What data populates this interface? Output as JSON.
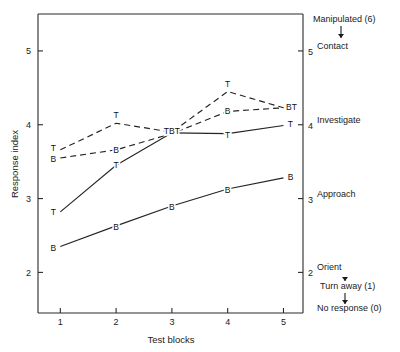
{
  "chart_data": {
    "type": "line",
    "title": "",
    "xlabel": "Test blocks",
    "ylabel": "Response index",
    "x": [
      1,
      2,
      3,
      4,
      5
    ],
    "xtick_labels": [
      "1",
      "2",
      "3",
      "4",
      "5"
    ],
    "xlim": [
      0.6,
      5.35
    ],
    "ylim": [
      1.45,
      5.5
    ],
    "ytick_values": [
      2,
      3,
      4,
      5
    ],
    "ytick_labels": [
      "2",
      "3",
      "4",
      "5"
    ],
    "grid": false,
    "legend_position": "none",
    "right_axis": {
      "tick_values": [
        2,
        3,
        4,
        5
      ],
      "tick_labels": [
        "2",
        "3",
        "4",
        "5"
      ],
      "category_labels": [
        {
          "value": 5,
          "label": "Contact"
        },
        {
          "value": 4,
          "label": "Investigate"
        },
        {
          "value": 3,
          "label": "Approach"
        },
        {
          "value": 2,
          "label": "Orient"
        }
      ],
      "top_annotation": "Manipulated (6)",
      "bottom_annotations": [
        "Turn away (1)",
        "No response (0)"
      ]
    },
    "series": [
      {
        "name": "T-dashed",
        "marker": "T",
        "linestyle": "dashed",
        "values": [
          3.66,
          4.02,
          3.9,
          4.45,
          4.23
        ]
      },
      {
        "name": "B-dashed",
        "marker": "B",
        "linestyle": "dashed",
        "values": [
          3.55,
          3.66,
          3.88,
          4.18,
          4.23
        ]
      },
      {
        "name": "T-solid",
        "marker": "T",
        "linestyle": "solid",
        "values": [
          2.82,
          3.45,
          3.89,
          3.88,
          3.99
        ]
      },
      {
        "name": "B-solid",
        "marker": "B",
        "linestyle": "solid",
        "values": [
          2.35,
          2.63,
          2.9,
          3.13,
          3.28
        ]
      }
    ],
    "point_label_overrides": {
      "block3": "TBT",
      "block5_dashed": "BT"
    }
  }
}
